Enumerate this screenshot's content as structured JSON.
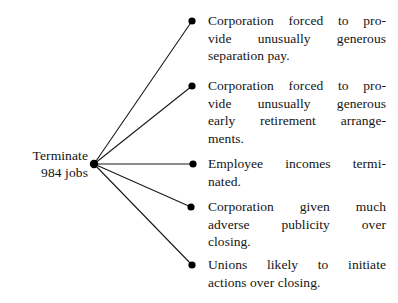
{
  "diagram": {
    "type": "fan-tree",
    "title_text": "Terminate 984 jobs",
    "root": {
      "lines": [
        "Terminate",
        "984 jobs"
      ],
      "x": 94,
      "y": 164
    },
    "edge_color": "#1a1a1a",
    "bullet_color": "#000000",
    "background": "#ffffff",
    "branches": [
      {
        "id": "branch-1",
        "bullet_x": 192,
        "bullet_y": 21,
        "lines": [
          "Corporation forced to pro-",
          "vide unusually generous",
          "separation pay."
        ],
        "text_top": 12
      },
      {
        "id": "branch-2",
        "bullet_x": 192,
        "bullet_y": 86,
        "lines": [
          "Corporation forced to pro-",
          "vide unusually generous",
          "early retirement arrange-",
          "ments."
        ],
        "text_top": 77
      },
      {
        "id": "branch-3",
        "bullet_x": 193,
        "bullet_y": 164,
        "lines": [
          "Employee incomes termi-",
          "nated."
        ],
        "text_top": 155
      },
      {
        "id": "branch-4",
        "bullet_x": 191,
        "bullet_y": 207,
        "lines": [
          "Corporation given much",
          "adverse publicity over",
          "closing."
        ],
        "text_top": 198
      },
      {
        "id": "branch-5",
        "bullet_x": 192,
        "bullet_y": 265,
        "lines": [
          "Unions likely to initiate",
          "actions over closing."
        ],
        "text_top": 256
      }
    ]
  }
}
